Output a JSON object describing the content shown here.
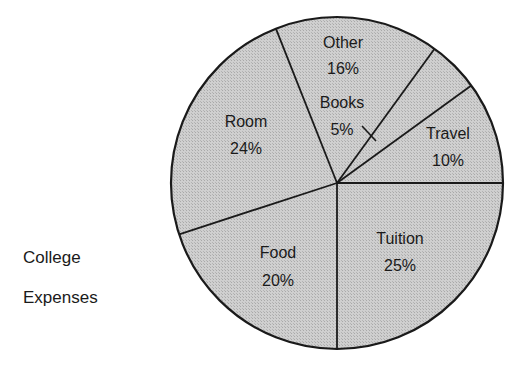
{
  "chart_data": {
    "type": "pie",
    "title": "College Expenses",
    "title_lines": [
      "College",
      "Expenses"
    ],
    "title_position": "left",
    "categories": [
      "Tuition",
      "Food",
      "Room",
      "Other",
      "Books",
      "Travel"
    ],
    "values": [
      25,
      20,
      24,
      16,
      5,
      10
    ],
    "unit": "%",
    "labels": [
      {
        "name": "Tuition",
        "pct": "25%"
      },
      {
        "name": "Food",
        "pct": "20%"
      },
      {
        "name": "Room",
        "pct": "24%"
      },
      {
        "name": "Other",
        "pct": "16%"
      },
      {
        "name": "Books",
        "pct": "5%"
      },
      {
        "name": "Travel",
        "pct": "10%"
      }
    ],
    "annotations": [
      "X mark pointing from Books label to Books wedge"
    ],
    "legend": "none (labels inside slices)",
    "fill_color": "#c8c8c8",
    "edge_color": "#1a1a1a"
  },
  "side_title": {
    "line1": "College",
    "line2": "Expenses"
  }
}
